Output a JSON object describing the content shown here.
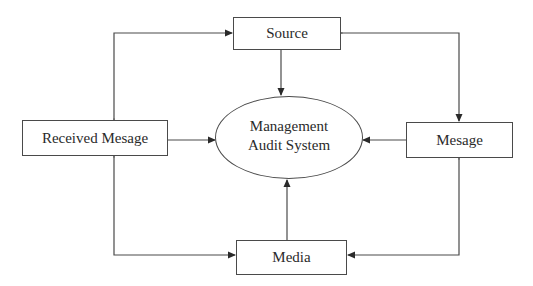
{
  "diagram": {
    "type": "data-flow",
    "nodes": {
      "center": {
        "shape": "ellipse",
        "line1": "Management",
        "line2": "Audit System"
      },
      "source": {
        "shape": "rectangle",
        "label": "Source"
      },
      "received": {
        "shape": "rectangle",
        "label": "Received Mesage"
      },
      "message": {
        "shape": "rectangle",
        "label": "Mesage"
      },
      "media": {
        "shape": "rectangle",
        "label": "Media"
      }
    },
    "edges": [
      {
        "from": "source",
        "to": "center",
        "direction": "one-way"
      },
      {
        "from": "received",
        "to": "center",
        "direction": "one-way"
      },
      {
        "from": "message",
        "to": "center",
        "direction": "one-way"
      },
      {
        "from": "media",
        "to": "center",
        "direction": "one-way"
      },
      {
        "from": "source",
        "to": "received",
        "direction": "bidirectional"
      },
      {
        "from": "source",
        "to": "message",
        "direction": "bidirectional"
      },
      {
        "from": "received",
        "to": "media",
        "direction": "bidirectional"
      },
      {
        "from": "message",
        "to": "media",
        "direction": "bidirectional"
      }
    ],
    "colors": {
      "stroke": "#4a4a4a",
      "text": "#2a2a2a",
      "background": "#ffffff"
    }
  }
}
